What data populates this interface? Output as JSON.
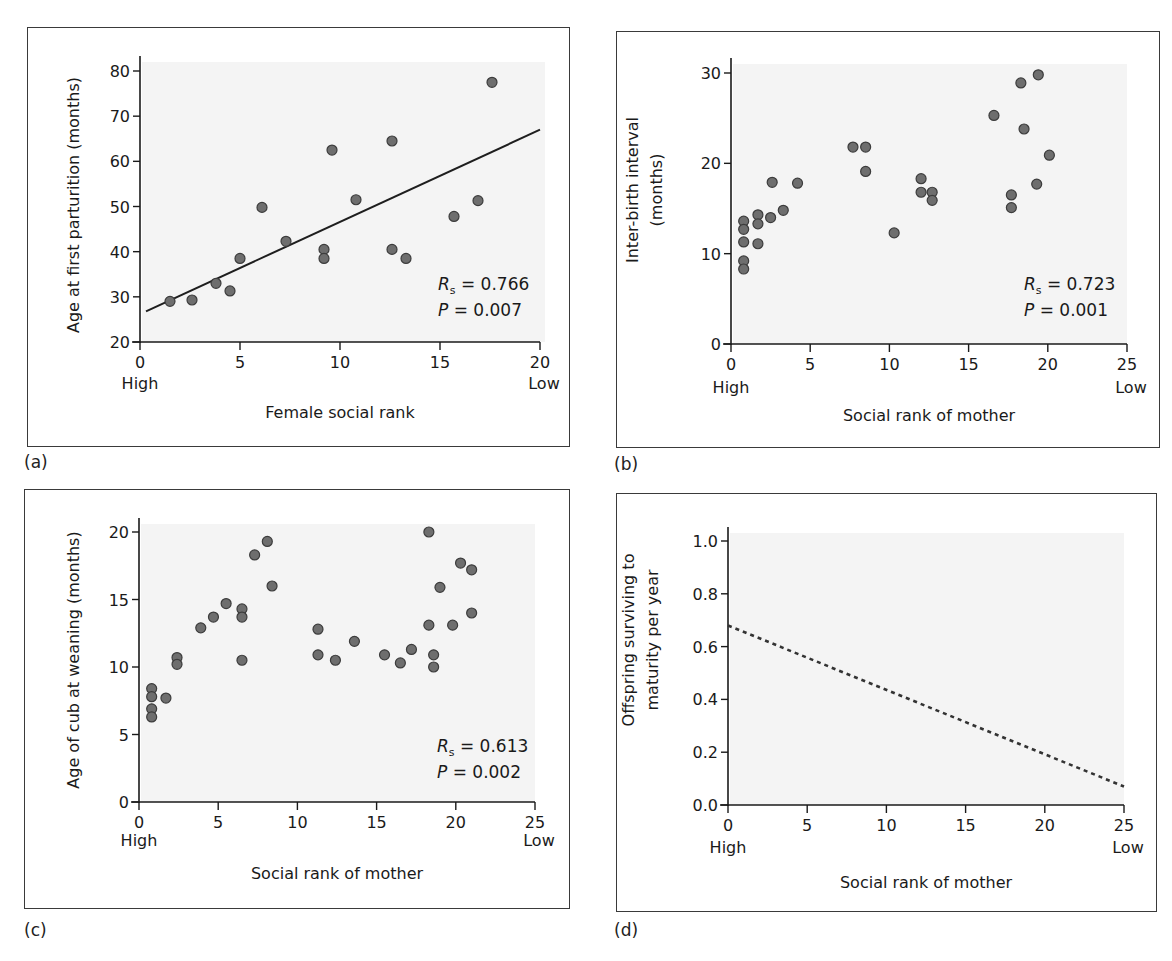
{
  "panels": [
    {
      "id": "a",
      "label": "(a)",
      "xlabel": "Female social rank",
      "ylabel": "Age at first parturition (months)",
      "ylabel_lines": [
        "Age at first parturition (months)"
      ],
      "x_low_label": "High",
      "x_high_label": "Low",
      "stat_rs_symbol": "R",
      "stat_rs_sub": "s",
      "stat_rs_value": "= 0.766",
      "stat_p_symbol": "P",
      "stat_p_value": "= 0.007"
    },
    {
      "id": "b",
      "label": "(b)",
      "xlabel": "Social rank of mother",
      "ylabel": "Inter-birth interval (months)",
      "ylabel_lines": [
        "Inter-birth interval",
        "(months)"
      ],
      "x_low_label": "High",
      "x_high_label": "Low",
      "stat_rs_symbol": "R",
      "stat_rs_sub": "s",
      "stat_rs_value": "= 0.723",
      "stat_p_symbol": "P",
      "stat_p_value": "= 0.001"
    },
    {
      "id": "c",
      "label": "(c)",
      "xlabel": "Social rank of mother",
      "ylabel": "Age of cub at weaning (months)",
      "ylabel_lines": [
        "Age of cub at weaning (months)"
      ],
      "x_low_label": "High",
      "x_high_label": "Low",
      "stat_rs_symbol": "R",
      "stat_rs_sub": "s",
      "stat_rs_value": "= 0.613",
      "stat_p_symbol": "P",
      "stat_p_value": "= 0.002"
    },
    {
      "id": "d",
      "label": "(d)",
      "xlabel": "Social rank of mother",
      "ylabel": "Offspring surviving to maturity per year",
      "ylabel_lines": [
        "Offspring surviving to",
        "maturity per year"
      ],
      "x_low_label": "High",
      "x_high_label": "Low"
    }
  ],
  "colors": {
    "plot_background": "#f4f4f4",
    "point_fill": "#6e6e6e",
    "point_stroke": "#3c3c3c",
    "line": "#1e1e1e",
    "axis": "#1a1a1a",
    "frame": "#3a3a3a"
  },
  "chart_data": [
    {
      "panel": "a",
      "type": "scatter",
      "title": "",
      "xlabel": "Female social rank",
      "ylabel": "Age at first parturition (months)",
      "xlim": [
        0,
        20
      ],
      "ylim": [
        20,
        80
      ],
      "xticks": [
        0,
        5,
        10,
        15,
        20
      ],
      "yticks": [
        20,
        30,
        40,
        50,
        60,
        70,
        80
      ],
      "x_annotations": {
        "0": "High",
        "20": "Low"
      },
      "grid": false,
      "points": [
        [
          1.5,
          29.0
        ],
        [
          2.6,
          29.3
        ],
        [
          3.8,
          33.0
        ],
        [
          4.5,
          31.3
        ],
        [
          5.0,
          38.5
        ],
        [
          6.1,
          49.8
        ],
        [
          7.3,
          42.3
        ],
        [
          9.2,
          40.5
        ],
        [
          9.2,
          38.5
        ],
        [
          9.6,
          62.5
        ],
        [
          10.8,
          51.5
        ],
        [
          12.6,
          64.5
        ],
        [
          12.6,
          40.5
        ],
        [
          13.3,
          38.5
        ],
        [
          15.7,
          47.8
        ],
        [
          16.9,
          51.3
        ],
        [
          17.6,
          77.5
        ]
      ],
      "fit_line": {
        "style": "solid",
        "from": [
          0.3,
          26.8
        ],
        "to": [
          20,
          67.0
        ]
      },
      "annotations": [
        "Rs = 0.766",
        "P = 0.007"
      ]
    },
    {
      "panel": "b",
      "type": "scatter",
      "title": "",
      "xlabel": "Social rank of mother",
      "ylabel": "Inter-birth interval (months)",
      "xlim": [
        0,
        25
      ],
      "ylim": [
        0,
        30
      ],
      "xticks": [
        0,
        5,
        10,
        15,
        20,
        25
      ],
      "yticks": [
        0,
        10,
        20,
        30
      ],
      "x_annotations": {
        "0": "High",
        "25": "Low"
      },
      "grid": false,
      "points": [
        [
          0.8,
          13.6
        ],
        [
          0.8,
          12.7
        ],
        [
          0.8,
          11.3
        ],
        [
          0.8,
          9.2
        ],
        [
          0.8,
          8.3
        ],
        [
          1.7,
          14.3
        ],
        [
          1.7,
          13.3
        ],
        [
          1.7,
          11.1
        ],
        [
          2.5,
          14.0
        ],
        [
          2.6,
          17.9
        ],
        [
          3.3,
          14.8
        ],
        [
          4.2,
          17.8
        ],
        [
          7.7,
          21.8
        ],
        [
          8.5,
          21.8
        ],
        [
          8.5,
          19.1
        ],
        [
          10.3,
          12.3
        ],
        [
          12.0,
          18.3
        ],
        [
          12.0,
          16.8
        ],
        [
          12.7,
          16.8
        ],
        [
          12.7,
          15.9
        ],
        [
          16.6,
          25.3
        ],
        [
          17.7,
          16.5
        ],
        [
          17.7,
          15.1
        ],
        [
          18.3,
          28.9
        ],
        [
          18.5,
          23.8
        ],
        [
          19.3,
          17.7
        ],
        [
          19.4,
          29.8
        ],
        [
          20.1,
          20.9
        ]
      ],
      "annotations": [
        "Rs = 0.723",
        "P = 0.001"
      ]
    },
    {
      "panel": "c",
      "type": "scatter",
      "title": "",
      "xlabel": "Social rank of mother",
      "ylabel": "Age of cub at weaning (months)",
      "xlim": [
        0,
        25
      ],
      "ylim": [
        0,
        20
      ],
      "xticks": [
        0,
        5,
        10,
        15,
        20,
        25
      ],
      "yticks": [
        0,
        5,
        10,
        15,
        20
      ],
      "x_annotations": {
        "0": "High",
        "25": "Low"
      },
      "grid": false,
      "points": [
        [
          0.8,
          8.4
        ],
        [
          0.8,
          7.8
        ],
        [
          0.8,
          6.9
        ],
        [
          0.8,
          6.3
        ],
        [
          1.7,
          7.7
        ],
        [
          2.4,
          10.7
        ],
        [
          2.4,
          10.2
        ],
        [
          3.9,
          12.9
        ],
        [
          4.7,
          13.7
        ],
        [
          5.5,
          14.7
        ],
        [
          6.5,
          14.3
        ],
        [
          6.5,
          13.7
        ],
        [
          6.5,
          10.5
        ],
        [
          7.3,
          18.3
        ],
        [
          8.1,
          19.3
        ],
        [
          8.4,
          16.0
        ],
        [
          11.3,
          12.8
        ],
        [
          11.3,
          10.9
        ],
        [
          12.4,
          10.5
        ],
        [
          13.6,
          11.9
        ],
        [
          15.5,
          10.9
        ],
        [
          16.5,
          10.3
        ],
        [
          17.2,
          11.3
        ],
        [
          18.3,
          20.0
        ],
        [
          18.3,
          13.1
        ],
        [
          18.6,
          10.9
        ],
        [
          18.6,
          10.0
        ],
        [
          19.0,
          15.9
        ],
        [
          19.8,
          13.1
        ],
        [
          20.3,
          17.7
        ],
        [
          21.0,
          17.2
        ],
        [
          21.0,
          14.0
        ]
      ],
      "annotations": [
        "Rs = 0.613",
        "P = 0.002"
      ]
    },
    {
      "panel": "d",
      "type": "line",
      "title": "",
      "xlabel": "Social rank of mother",
      "ylabel": "Offspring surviving to maturity per year",
      "xlim": [
        0,
        25
      ],
      "ylim": [
        0.0,
        1.0
      ],
      "xticks": [
        0,
        5,
        10,
        15,
        20,
        25
      ],
      "yticks": [
        0.0,
        0.2,
        0.4,
        0.6,
        0.8,
        1.0
      ],
      "x_annotations": {
        "0": "High",
        "25": "Low"
      },
      "grid": false,
      "series": [
        {
          "name": "trend",
          "style": "dashed",
          "x": [
            0,
            25
          ],
          "y": [
            0.68,
            0.07
          ]
        }
      ]
    }
  ]
}
